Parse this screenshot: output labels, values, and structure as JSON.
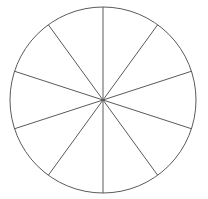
{
  "figure": {
    "type": "circle-sector-diagram",
    "background_color": "#ffffff",
    "line_color": "#5a5a5a",
    "outline_color": "#5a5a5a",
    "line_width": 1,
    "outline_width": 1,
    "sector_count": 10,
    "divider_count": 5,
    "sector_angle_degrees": 36,
    "fill": "none",
    "labels": [],
    "center": {
      "x": 103,
      "y": 100
    },
    "radius": 93
  },
  "chart_data": {
    "type": "pie",
    "title": "",
    "subtitle": "",
    "xlabel": "",
    "ylabel": "",
    "categories": [
      "1",
      "2",
      "3",
      "4",
      "5",
      "6",
      "7",
      "8",
      "9",
      "10"
    ],
    "values": [
      10,
      10,
      10,
      10,
      10,
      10,
      10,
      10,
      10,
      10
    ],
    "slice_angles_degrees": [
      36,
      36,
      36,
      36,
      36,
      36,
      36,
      36,
      36,
      36
    ],
    "start_angle_degrees": 90,
    "grid": false,
    "legend": "none",
    "colors": [
      "none",
      "none",
      "none",
      "none",
      "none",
      "none",
      "none",
      "none",
      "none",
      "none"
    ],
    "stroke": "#5a5a5a",
    "annotations": [],
    "divider_endpoint_angles_degrees": [
      90,
      126,
      162,
      198,
      234,
      270,
      306,
      342,
      18,
      54
    ]
  }
}
